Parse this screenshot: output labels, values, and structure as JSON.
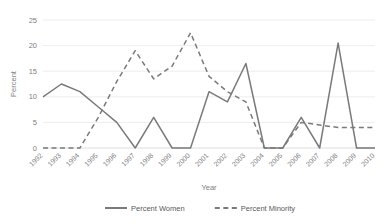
{
  "chart_data": {
    "type": "line",
    "title": "",
    "xlabel": "Year",
    "ylabel": "Percent",
    "ylim": [
      0,
      25
    ],
    "yticks": [
      0,
      5,
      10,
      15,
      20,
      25
    ],
    "grid": true,
    "legend_position": "bottom",
    "categories": [
      "1992",
      "1993",
      "1994",
      "1995",
      "1996",
      "1997",
      "1998",
      "1999",
      "2000",
      "2001",
      "2002",
      "2003",
      "2004",
      "2005",
      "2006",
      "2007",
      "2008",
      "2009",
      "2010"
    ],
    "series": [
      {
        "name": "Percent Women",
        "style": "solid",
        "color": "#7a7a7a",
        "values": [
          10,
          12.5,
          11,
          8,
          5,
          0,
          6,
          0,
          0,
          11,
          9,
          16.5,
          0,
          0,
          6,
          0,
          20.5,
          0,
          0
        ]
      },
      {
        "name": "Percent Minority",
        "style": "dashed",
        "color": "#7a7a7a",
        "values": [
          0,
          0,
          0,
          6,
          13,
          19,
          13.5,
          16,
          22.5,
          14,
          11,
          9,
          0,
          0,
          5,
          4.5,
          4,
          4,
          4
        ]
      }
    ]
  },
  "axis": {
    "y_title": "Percent",
    "x_title": "Year"
  },
  "legend": {
    "items": [
      {
        "label": "Percent Women"
      },
      {
        "label": "Percent Minority"
      }
    ]
  }
}
